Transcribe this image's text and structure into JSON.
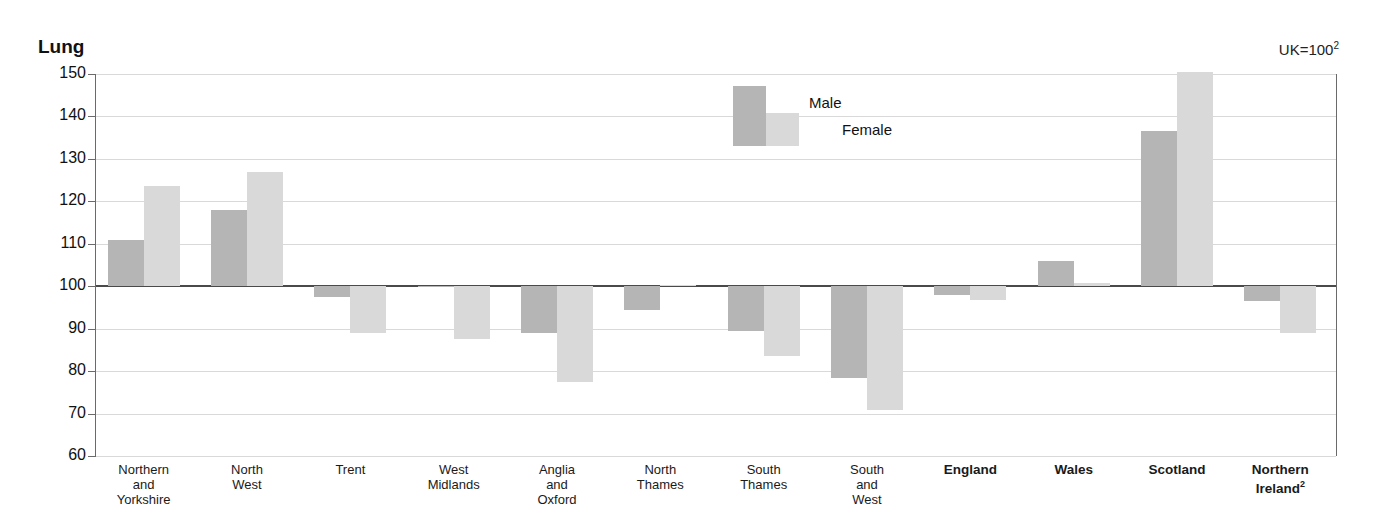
{
  "masthead": "1.16",
  "chart_title": "Lung",
  "uk_note": {
    "text": "UK=100",
    "sup": "2"
  },
  "legend": {
    "male": "Male",
    "female": "Female"
  },
  "chart_data": {
    "type": "bar",
    "title": "Lung",
    "subtitle": "UK=100",
    "xlabel": "",
    "ylabel": "",
    "ylim": [
      60,
      150
    ],
    "yticks": [
      60,
      70,
      80,
      90,
      100,
      110,
      120,
      130,
      140,
      150
    ],
    "grid": true,
    "reference_line": 100,
    "legend_position": "inside-top-center",
    "colors": {
      "male": "#b5b5b5",
      "female": "#d9d9d9"
    },
    "categories": [
      "Northern and Yorkshire",
      "North West",
      "Trent",
      "West Midlands",
      "Anglia and Oxford",
      "North Thames",
      "South Thames",
      "South and West",
      "England",
      "Wales",
      "Scotland",
      "Northern Ireland"
    ],
    "series": [
      {
        "name": "Male",
        "values": [
          111.0,
          118.0,
          97.5,
          100.0,
          89.0,
          94.5,
          89.5,
          78.3,
          98.0,
          106.0,
          136.5,
          96.5
        ]
      },
      {
        "name": "Female",
        "values": [
          123.5,
          127.0,
          89.0,
          87.5,
          77.5,
          100.3,
          83.5,
          70.8,
          96.7,
          100.7,
          150.5,
          89.0
        ]
      }
    ]
  },
  "category_labels": [
    {
      "lines": [
        "Northern",
        "and",
        "Yorkshire"
      ],
      "bold": false
    },
    {
      "lines": [
        "North",
        "West"
      ],
      "bold": false
    },
    {
      "lines": [
        "Trent"
      ],
      "bold": false
    },
    {
      "lines": [
        "West",
        "Midlands"
      ],
      "bold": false
    },
    {
      "lines": [
        "Anglia",
        "and",
        "Oxford"
      ],
      "bold": false
    },
    {
      "lines": [
        "North",
        "Thames"
      ],
      "bold": false
    },
    {
      "lines": [
        "South",
        "Thames"
      ],
      "bold": false
    },
    {
      "lines": [
        "South",
        "and",
        "West"
      ],
      "bold": false
    },
    {
      "lines": [
        "England"
      ],
      "bold": true
    },
    {
      "lines": [
        "Wales"
      ],
      "bold": true
    },
    {
      "lines": [
        "Scotland"
      ],
      "bold": true
    },
    {
      "lines": [
        "Northern",
        "Ireland"
      ],
      "bold": true,
      "sup": "2"
    }
  ]
}
